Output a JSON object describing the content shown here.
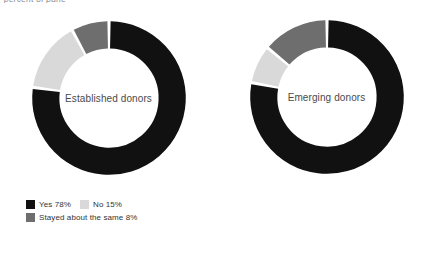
{
  "top_fragment": "percent of pane",
  "charts": [
    {
      "center_label": "Established donors",
      "legend_rows": [
        [
          {
            "label": "Yes 78%",
            "color": "#111111"
          },
          {
            "label": "No 15%",
            "color": "#d9d9d9"
          }
        ],
        [
          {
            "label": "Stayed about the same 8%",
            "color": "#6e6e6e"
          }
        ]
      ]
    },
    {
      "center_label": "Emerging donors",
      "legend_rows": [
        [
          {
            "label": "Yes 78%",
            "color": "#111111"
          },
          {
            "label": "No 8%",
            "color": "#d9d9d9"
          }
        ],
        [
          {
            "label": "Stayed about the same 14%",
            "color": "#6e6e6e"
          }
        ]
      ]
    }
  ],
  "chart_data": [
    {
      "type": "pie",
      "variant": "donut",
      "title": "Established donors",
      "categories": [
        "Yes",
        "No",
        "Stayed about the same"
      ],
      "values": [
        78,
        15,
        8
      ],
      "value_labels": [
        "78%",
        "15%",
        "8%"
      ],
      "colors": [
        "#111111",
        "#d9d9d9",
        "#6e6e6e"
      ],
      "units": "percent",
      "start_angle_deg": 0,
      "direction": "clockwise",
      "legend": [
        "Yes 78%",
        "No 15%",
        "Stayed about the same 8%"
      ],
      "legend_position": "bottom-left",
      "center_label": "Established donors",
      "total": 101,
      "grid": false
    },
    {
      "type": "pie",
      "variant": "donut",
      "title": "Emerging donors",
      "categories": [
        "Yes",
        "No",
        "Stayed about the same"
      ],
      "values": [
        78,
        8,
        14
      ],
      "value_labels": [
        "78%",
        "8%",
        "14%"
      ],
      "colors": [
        "#111111",
        "#d9d9d9",
        "#6e6e6e"
      ],
      "units": "percent",
      "start_angle_deg": 0,
      "direction": "clockwise",
      "legend": [
        "Yes 78%",
        "No 8%",
        "Stayed about the same 14%"
      ],
      "legend_position": "bottom-left",
      "center_label": "Emerging donors",
      "total": 100,
      "grid": false
    }
  ],
  "colors": {
    "yes": "#111111",
    "no": "#d9d9d9",
    "same": "#6e6e6e",
    "background": "#ffffff",
    "text": "#333333"
  }
}
